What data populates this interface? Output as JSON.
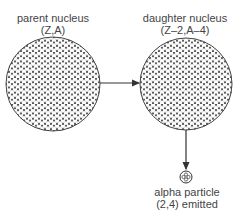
{
  "diagram": {
    "title_cut": "Figure ... alpha decay",
    "parent": {
      "label": "parent nucleus",
      "sub": "(Z,A)"
    },
    "daughter": {
      "label": "daughter nucleus",
      "sub": "(Z–2,A–4)"
    },
    "alpha": {
      "label": "alpha particle",
      "sub": "(2,4) emitted"
    },
    "colors": {
      "line": "#333333",
      "fill": "#555555",
      "bg": "#ffffff"
    }
  }
}
